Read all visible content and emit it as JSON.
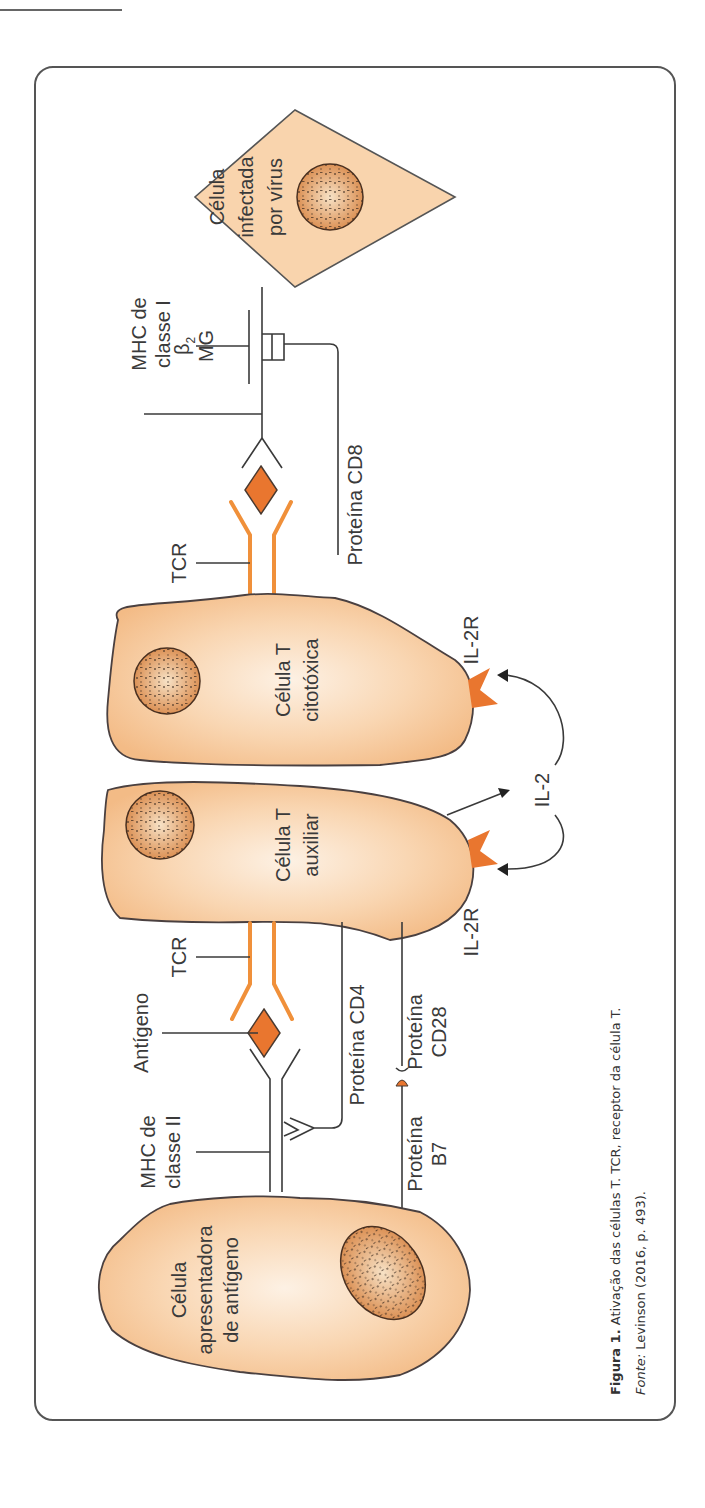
{
  "figure": {
    "orientation": "rotated-90-ccw",
    "colors": {
      "cell_fill": "#f6c79a",
      "cell_fill_light": "#fde9d6",
      "receptor_orange": "#f0903a",
      "antigen_orange": "#e9762f",
      "line": "#3a3a3a",
      "frame": "#555555"
    },
    "cells": {
      "apc": {
        "label_lines": [
          "Célula",
          "apresentadora",
          "de antígeno"
        ]
      },
      "helper": {
        "label_lines": [
          "Célula T",
          "auxiliar"
        ]
      },
      "cytotoxic": {
        "label_lines": [
          "Célula T",
          "citotóxica"
        ]
      },
      "infected": {
        "label_lines": [
          "Célula",
          "infectada",
          "por vírus"
        ]
      }
    },
    "labels": {
      "mhc2": [
        "MHC de",
        "classe II"
      ],
      "antigen": "Antígeno",
      "tcr_helper": "TCR",
      "cd4": "Proteína CD4",
      "b7": [
        "Proteína",
        "B7"
      ],
      "cd28": [
        "Proteína",
        "CD28"
      ],
      "il2r_helper": "IL-2R",
      "il2": "IL-2",
      "il2r_cyto": "IL-2R",
      "tcr_cyto": "TCR",
      "cd8": "Proteína CD8",
      "mhc1": [
        "MHC de",
        "classe I"
      ],
      "b2mg_top": "β",
      "b2mg_sub": "2",
      "b2mg_bottom": "MG"
    },
    "caption": {
      "fig_label": "Figura 1.",
      "fig_text": " Ativação das células T. TCR, receptor da célula T.",
      "source_label": "Fonte:",
      "source_text": " Levinson (2016, p. 493)."
    }
  }
}
